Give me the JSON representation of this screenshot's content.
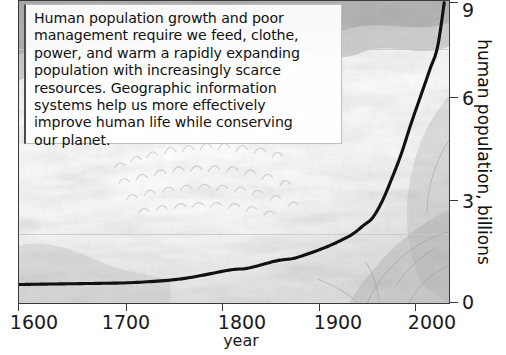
{
  "annotation": {
    "text": "Human population growth and poor\nmanagement require we feed, clothe,\npower, and warm a rapidly expanding\npopulation with increasingly scarce\nresources.  Geographic information\nsystems help us more effectively\nimprove human life while conserving\nour planet."
  },
  "colors": {
    "curve": "#111111",
    "frame": "#3a3a3a",
    "gridline": "#c9c9c9",
    "text": "#111111",
    "panel_background": "#ffffff"
  },
  "chart_data": {
    "type": "line",
    "title": "",
    "xlabel": "year",
    "ylabel": "human population, billions",
    "xlim": [
      1580,
      2030
    ],
    "ylim": [
      0,
      9
    ],
    "xticks": [
      1600,
      1700,
      1800,
      1900,
      2000
    ],
    "xticklabels": [
      "1600",
      "1700",
      "1800",
      "1900",
      "2000"
    ],
    "yticks": [
      0,
      3,
      6,
      9
    ],
    "yticklabels": [
      "0",
      "3",
      "6",
      "9"
    ],
    "y_axis_side": "right",
    "grid": "horizontal-faint",
    "gridline_values": [
      2,
      7.6
    ],
    "legend": "none",
    "series": [
      {
        "name": "human population",
        "x": [
          1580,
          1600,
          1650,
          1700,
          1750,
          1800,
          1820,
          1850,
          1870,
          1900,
          1920,
          1930,
          1940,
          1950,
          1960,
          1970,
          1980,
          1990,
          2000,
          2010,
          2018,
          2025
        ],
        "values": [
          0.55,
          0.56,
          0.58,
          0.61,
          0.72,
          0.98,
          1.04,
          1.26,
          1.35,
          1.65,
          1.91,
          2.07,
          2.3,
          2.54,
          3.03,
          3.7,
          4.44,
          5.32,
          6.14,
          6.96,
          7.63,
          8.95
        ]
      }
    ]
  },
  "axes": {
    "x_tick_labels": [
      "1600",
      "1700",
      "1800",
      "1900",
      "2000"
    ],
    "x_title": "year",
    "y_tick_labels": [
      "9",
      "6",
      "3",
      "0"
    ],
    "y_title": "human population, billions"
  }
}
